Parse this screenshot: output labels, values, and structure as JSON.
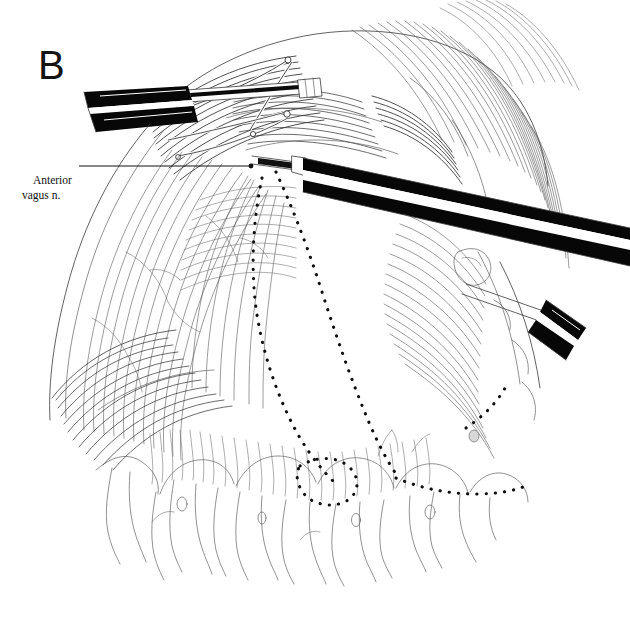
{
  "figure": {
    "panel_label": "B",
    "background_color": "#ffffff",
    "ink_color": "#1a1a1a",
    "width": 630,
    "height": 620
  },
  "annotations": [
    {
      "id": "anterior-vagus-nerve",
      "line1": "Anterior",
      "line2": "vagus n.",
      "leader": {
        "x1": 79,
        "y1": 166,
        "x2": 250,
        "y2": 166
      }
    }
  ],
  "instruments": [
    {
      "id": "upper-left-clamp",
      "name": "clamp-jaws-upper-left",
      "color": "#000000"
    },
    {
      "id": "center-grasper",
      "name": "laparoscopic-grasper-shaft",
      "color": "#000000"
    },
    {
      "id": "lower-right-grasper",
      "name": "laparoscopic-grasper-lower-right",
      "color": "#000000"
    }
  ],
  "dissection_lines": [
    {
      "id": "dissection-line-left",
      "style": "dotted"
    },
    {
      "id": "dissection-line-right",
      "style": "dotted"
    },
    {
      "id": "dissection-loop-bottom",
      "style": "dotted"
    }
  ]
}
